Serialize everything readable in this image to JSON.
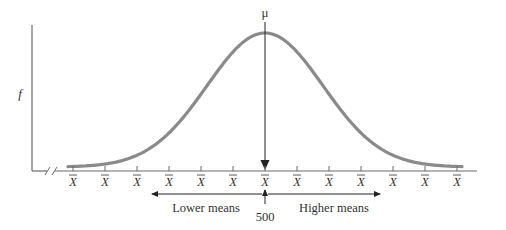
{
  "diagram": {
    "title_symbol": "μ",
    "y_axis_label": "f",
    "tick_label": "X",
    "tick_count": 13,
    "tick_x": [
      73,
      105,
      137,
      169,
      201,
      233,
      265,
      297,
      329,
      361,
      393,
      425,
      457
    ],
    "center_value": "500",
    "lower_label": "Lower means",
    "higher_label": "Higher means",
    "colors": {
      "curve": "#8a8a8a",
      "axis": "#6a6a6a",
      "text": "#333333",
      "arrow": "#222222"
    }
  },
  "chart_data": {
    "type": "line",
    "xlabel": "X̄",
    "ylabel": "f",
    "center": 500,
    "annotations": [
      "μ",
      "Lower means",
      "Higher means",
      "500"
    ],
    "shape": "bell-shaped, symmetric about μ = 500"
  }
}
